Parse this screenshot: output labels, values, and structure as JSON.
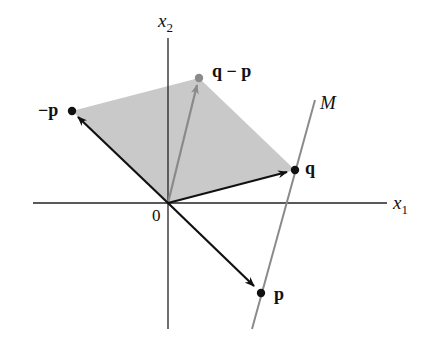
{
  "figure": {
    "axes": {
      "x_label": "x",
      "x_sub": "1",
      "y_label": "x",
      "y_sub": "2",
      "origin_label": "0"
    },
    "points": {
      "p": "p",
      "neg_p": "−p",
      "q": "q",
      "q_minus_p": "q − p"
    },
    "line_label": "M",
    "colors": {
      "shade": "#c9c9c9",
      "gray_vector": "#8a8a8a",
      "black_vector": "#111111"
    }
  }
}
